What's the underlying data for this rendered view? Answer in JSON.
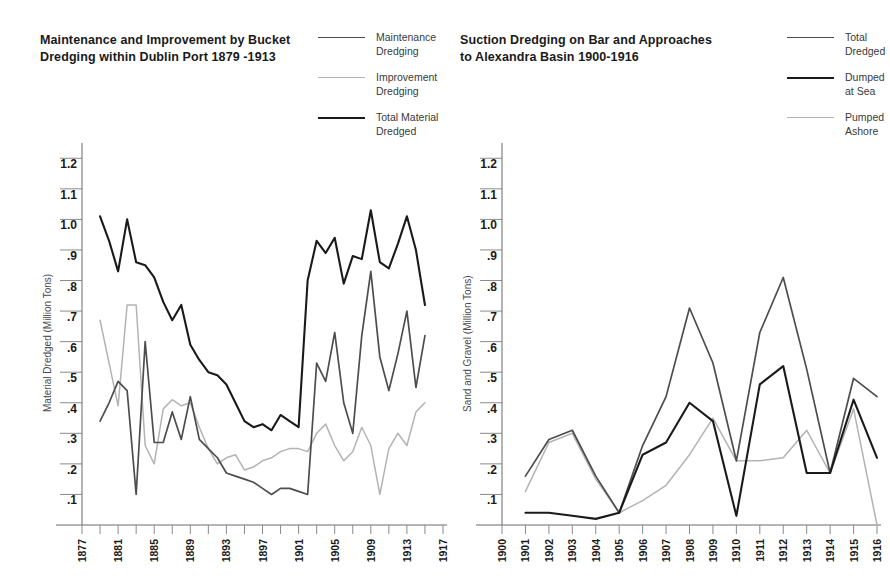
{
  "charts": [
    {
      "id": "bucket-dredging",
      "title": "Maintenance and Improvement by Bucket\nDredging within Dublin Port 1879 -1913",
      "ylabel": "Material Dredged (Million Tons)",
      "legend": [
        {
          "label": "Maintenance\nDredging",
          "color": "#4d4d4d"
        },
        {
          "label": "Improvement\nDredging",
          "color": "#b3b3b3"
        },
        {
          "label": "Total Material\nDredged",
          "color": "#1a1a1a"
        }
      ]
    },
    {
      "id": "suction-dredging",
      "title": "Suction Dredging on Bar and Approaches\nto Alexandra Basin 1900-1916",
      "ylabel": "Sand and Gravel (Million Tons)",
      "legend": [
        {
          "label": "Total\nDredged",
          "color": "#4d4d4d"
        },
        {
          "label": "Dumped\nat Sea",
          "color": "#1a1a1a"
        },
        {
          "label": "Pumped\nAshore",
          "color": "#b3b3b3"
        }
      ]
    }
  ],
  "chart_data": [
    {
      "type": "line",
      "title": "Maintenance and Improvement by Bucket Dredging within Dublin Port 1879 -1913",
      "xlabel": "",
      "ylabel": "Material Dredged (Million Tons)",
      "ylim": [
        0,
        1.25
      ],
      "yticks": [
        0.1,
        0.2,
        0.3,
        0.4,
        0.5,
        0.6,
        0.7,
        0.8,
        0.9,
        1.0,
        1.1,
        1.2
      ],
      "ytick_labels": [
        ".1",
        ".2",
        ".3",
        ".4",
        ".5",
        ".6",
        ".7",
        ".8",
        ".9",
        "1.0",
        "1.1",
        "1.2"
      ],
      "xlim": [
        1877,
        1917
      ],
      "xticks": [
        1877,
        1879,
        1881,
        1883,
        1885,
        1887,
        1889,
        1891,
        1893,
        1895,
        1897,
        1899,
        1901,
        1903,
        1905,
        1907,
        1909,
        1911,
        1913,
        1915,
        1917
      ],
      "xtick_labels": [
        "1877",
        "",
        "1881",
        "",
        "1885",
        "",
        "1889",
        "",
        "1893",
        "",
        "1897",
        "",
        "1901",
        "",
        "1905",
        "",
        "1909",
        "",
        "1913",
        "",
        "1917"
      ],
      "grid": true,
      "legend_position": "top-right",
      "x": [
        1879,
        1880,
        1881,
        1882,
        1883,
        1884,
        1885,
        1886,
        1887,
        1888,
        1889,
        1890,
        1891,
        1892,
        1893,
        1894,
        1895,
        1896,
        1897,
        1898,
        1899,
        1900,
        1901,
        1902,
        1903,
        1904,
        1905,
        1906,
        1907,
        1908,
        1909,
        1910,
        1911,
        1912,
        1913,
        1914,
        1915
      ],
      "series": [
        {
          "name": "Total Material Dredged",
          "color": "#1a1a1a",
          "values": [
            1.01,
            0.93,
            0.83,
            1.0,
            0.86,
            0.85,
            0.81,
            0.73,
            0.67,
            0.72,
            0.59,
            0.54,
            0.5,
            0.49,
            0.46,
            0.4,
            0.34,
            0.32,
            0.33,
            0.31,
            0.36,
            0.34,
            0.32,
            0.8,
            0.93,
            0.89,
            0.94,
            0.79,
            0.88,
            0.87,
            1.03,
            0.86,
            0.84,
            0.92,
            1.01,
            0.9,
            0.72
          ]
        },
        {
          "name": "Maintenance Dredging",
          "color": "#4d4d4d",
          "values": [
            0.34,
            0.4,
            0.47,
            0.44,
            0.1,
            0.6,
            0.27,
            0.27,
            0.37,
            0.28,
            0.42,
            0.28,
            0.25,
            0.22,
            0.17,
            0.16,
            0.15,
            0.14,
            0.12,
            0.1,
            0.12,
            0.12,
            0.11,
            0.1,
            0.53,
            0.47,
            0.63,
            0.4,
            0.3,
            0.62,
            0.83,
            0.55,
            0.44,
            0.56,
            0.7,
            0.45,
            0.62
          ]
        },
        {
          "name": "Improvement Dredging",
          "color": "#b3b3b3",
          "values": [
            0.67,
            0.53,
            0.39,
            0.72,
            0.72,
            0.26,
            0.2,
            0.38,
            0.41,
            0.39,
            0.4,
            0.32,
            0.25,
            0.2,
            0.22,
            0.23,
            0.18,
            0.19,
            0.21,
            0.22,
            0.24,
            0.25,
            0.25,
            0.24,
            0.3,
            0.33,
            0.26,
            0.21,
            0.24,
            0.32,
            0.26,
            0.1,
            0.25,
            0.3,
            0.26,
            0.37,
            0.4,
            0.46
          ]
        }
      ]
    },
    {
      "type": "line",
      "title": "Suction Dredging on Bar and Approaches to Alexandra Basin 1900-1916",
      "xlabel": "",
      "ylabel": "Sand and Gravel (Million Tons)",
      "ylim": [
        0,
        1.25
      ],
      "yticks": [
        0.1,
        0.2,
        0.3,
        0.4,
        0.5,
        0.6,
        0.7,
        0.8,
        0.9,
        1.0,
        1.1,
        1.2
      ],
      "ytick_labels": [
        ".1",
        ".2",
        ".3",
        ".4",
        ".5",
        ".6",
        ".7",
        ".8",
        ".9",
        "1.0",
        "1.1",
        "1.2"
      ],
      "xlim": [
        1900,
        1916
      ],
      "xticks": [
        1900,
        1901,
        1902,
        1903,
        1904,
        1905,
        1906,
        1907,
        1908,
        1909,
        1910,
        1911,
        1912,
        1913,
        1914,
        1915,
        1916
      ],
      "xtick_labels": [
        "1900",
        "1901",
        "1902",
        "1903",
        "1904",
        "1905",
        "1906",
        "1907",
        "1908",
        "1909",
        "1910",
        "1911",
        "1912",
        "1913",
        "1914",
        "1915",
        "1916"
      ],
      "grid": true,
      "legend_position": "top-right",
      "x": [
        1901,
        1902,
        1903,
        1904,
        1905,
        1906,
        1907,
        1908,
        1909,
        1910,
        1911,
        1912,
        1913,
        1914,
        1915,
        1916
      ],
      "series": [
        {
          "name": "Total Dredged",
          "color": "#4d4d4d",
          "values": [
            0.16,
            0.28,
            0.31,
            0.16,
            0.04,
            0.26,
            0.42,
            0.71,
            0.53,
            0.21,
            0.63,
            0.81,
            0.51,
            0.17,
            0.48,
            0.42
          ]
        },
        {
          "name": "Dumped at Sea",
          "color": "#1a1a1a",
          "values": [
            0.04,
            0.04,
            0.03,
            0.02,
            0.04,
            0.23,
            0.27,
            0.4,
            0.34,
            0.03,
            0.46,
            0.52,
            0.17,
            0.17,
            0.41,
            0.22
          ]
        },
        {
          "name": "Pumped Ashore",
          "color": "#b3b3b3",
          "values": [
            0.11,
            0.27,
            0.3,
            0.15,
            0.04,
            0.08,
            0.13,
            0.23,
            0.35,
            0.21,
            0.21,
            0.22,
            0.31,
            0.17,
            0.38,
            0.0
          ]
        }
      ]
    }
  ]
}
